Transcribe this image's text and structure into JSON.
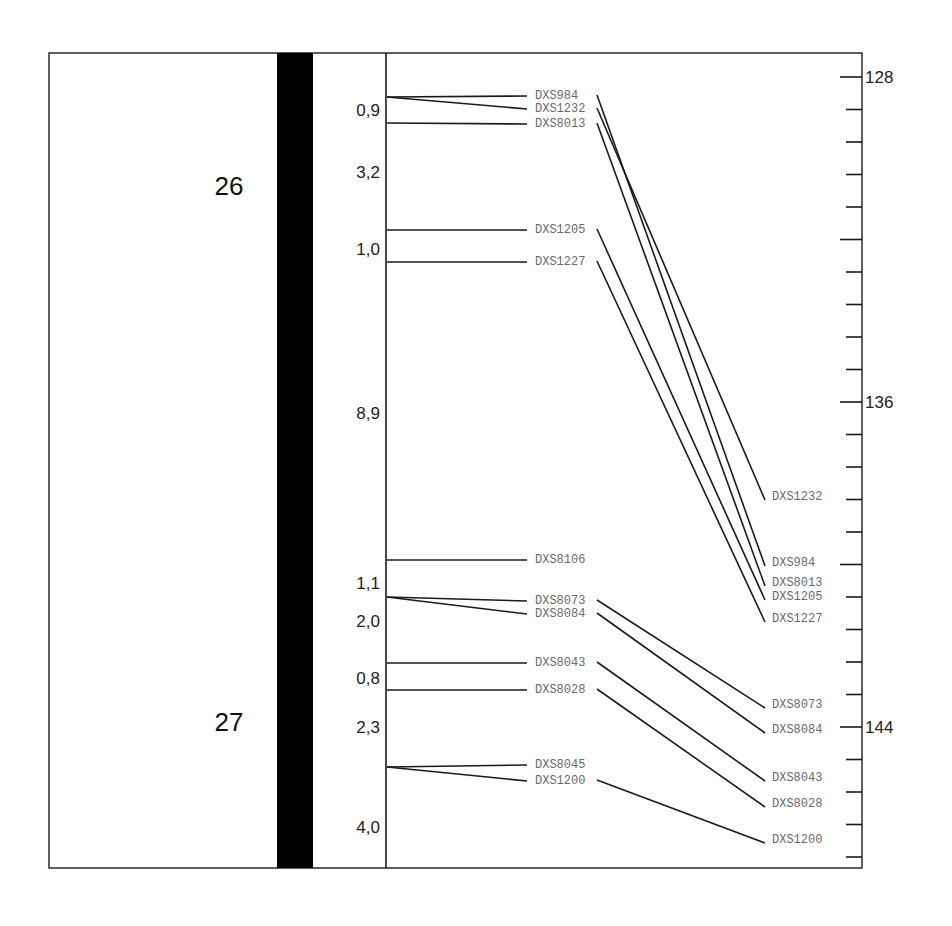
{
  "figure": {
    "frame": {
      "x": 49,
      "y": 53,
      "right": 862,
      "bottom": 868
    },
    "chromosome_bar": {
      "x": 277,
      "width": 36,
      "color": "#000000"
    },
    "map_axis_x": 386,
    "bands": [
      {
        "label": "26",
        "y": 186
      },
      {
        "label": "27",
        "y": 722
      }
    ],
    "distances": [
      {
        "label": "0,9",
        "y": 110
      },
      {
        "label": "3,2",
        "y": 172
      },
      {
        "label": "1,0",
        "y": 249
      },
      {
        "label": "8,9",
        "y": 413
      },
      {
        "label": "1,1",
        "y": 583
      },
      {
        "label": "2,0",
        "y": 621
      },
      {
        "label": "0,8",
        "y": 678
      },
      {
        "label": "2,3",
        "y": 727
      },
      {
        "label": "4,0",
        "y": 827
      }
    ],
    "left_markers": [
      {
        "name": "DXS984",
        "map_y": 97,
        "label_y": 96
      },
      {
        "name": "DXS1232",
        "map_y": 97,
        "label_y": 109
      },
      {
        "name": "DXS8013",
        "map_y": 123,
        "label_y": 124
      },
      {
        "name": "DXS1205",
        "map_y": 230,
        "label_y": 230
      },
      {
        "name": "DXS1227",
        "map_y": 262,
        "label_y": 262
      },
      {
        "name": "DXS8106",
        "map_y": 560,
        "label_y": 560
      },
      {
        "name": "DXS8073",
        "map_y": 597,
        "label_y": 601
      },
      {
        "name": "DXS8084",
        "map_y": 597,
        "label_y": 614
      },
      {
        "name": "DXS8043",
        "map_y": 663,
        "label_y": 663
      },
      {
        "name": "DXS8028",
        "map_y": 690,
        "label_y": 690
      },
      {
        "name": "DXS8045",
        "map_y": 767,
        "label_y": 765
      },
      {
        "name": "DXS1200",
        "map_y": 767,
        "label_y": 781
      }
    ],
    "right_markers": [
      {
        "name": "DXS1232",
        "y": 497,
        "from": "DXS1232"
      },
      {
        "name": "DXS984",
        "y": 563,
        "from": "DXS984"
      },
      {
        "name": "DXS8013",
        "y": 583,
        "from": "DXS8013"
      },
      {
        "name": "DXS1205",
        "y": 597,
        "from": "DXS1205"
      },
      {
        "name": "DXS1227",
        "y": 619,
        "from": "DXS1227"
      },
      {
        "name": "DXS8073",
        "y": 705,
        "from": "DXS8073"
      },
      {
        "name": "DXS8084",
        "y": 730,
        "from": "DXS8084"
      },
      {
        "name": "DXS8043",
        "y": 778,
        "from": "DXS8043"
      },
      {
        "name": "DXS8028",
        "y": 804,
        "from": "DXS8028"
      },
      {
        "name": "DXS1200",
        "y": 840,
        "from": "DXS1200"
      }
    ],
    "position_axis": {
      "x": 862,
      "first_tick_y": 77,
      "tick_spacing": 32.5,
      "tick_count": 25,
      "major_every": 5,
      "major_labels": [
        "128",
        "132",
        "136",
        "140",
        "144"
      ],
      "visible_labels": [
        {
          "label": "128",
          "tick_index": 0
        },
        {
          "label": "136",
          "tick_index": 10
        },
        {
          "label": "144",
          "tick_index": 20
        }
      ]
    }
  }
}
